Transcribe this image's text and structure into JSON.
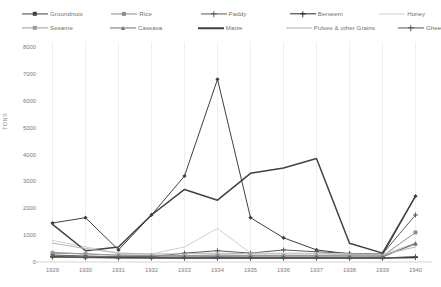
{
  "chart_data": {
    "type": "line",
    "title": "",
    "xlabel": "",
    "ylabel": "TONS",
    "ylim": [
      0,
      8000
    ],
    "ytick_values": [
      0,
      1000,
      2000,
      3000,
      4000,
      5000,
      6000,
      7000,
      8000
    ],
    "ytick_labels": [
      "0",
      "1000",
      "2000",
      "3000",
      "4000",
      "5000",
      "6000",
      "7000",
      "8000"
    ],
    "grid": "vertical",
    "legend_position": "top",
    "categories": [
      "1929",
      "1930",
      "1931",
      "1932",
      "1933",
      "1934",
      "1935",
      "1936",
      "1937",
      "1938",
      "1939",
      "1940"
    ],
    "series": [
      {
        "name": "Groundnuts",
        "color": "#3f3f3f",
        "marker": "diamond",
        "width": 1.0,
        "values": [
          1450,
          1650,
          450,
          1750,
          3200,
          6800,
          1650,
          900,
          450,
          300,
          260,
          2450
        ]
      },
      {
        "name": "Rice",
        "color": "#8c8c8c",
        "marker": "square",
        "width": 1.0,
        "values": [
          330,
          300,
          250,
          240,
          230,
          260,
          240,
          240,
          240,
          230,
          220,
          1100
        ]
      },
      {
        "name": "Paddy",
        "color": "#5a5a5a",
        "marker": "cross",
        "width": 1.0,
        "values": [
          260,
          220,
          200,
          200,
          330,
          420,
          330,
          450,
          380,
          320,
          300,
          1750
        ]
      },
      {
        "name": "Berseem",
        "color": "#2b2b2b",
        "marker": "cross",
        "width": 1.4,
        "values": [
          200,
          180,
          170,
          160,
          150,
          150,
          150,
          150,
          150,
          150,
          150,
          170
        ]
      },
      {
        "name": "Honey",
        "color": "#cfcfcf",
        "marker": "none",
        "width": 1.0,
        "values": [
          800,
          560,
          330,
          300,
          560,
          1250,
          330,
          330,
          330,
          300,
          280,
          700
        ]
      },
      {
        "name": "Sesame",
        "color": "#9a9a9a",
        "marker": "diamond",
        "width": 1.0,
        "values": [
          360,
          300,
          260,
          250,
          240,
          250,
          240,
          240,
          240,
          230,
          230,
          660
        ]
      },
      {
        "name": "Cassava",
        "color": "#707070",
        "marker": "triangle",
        "width": 1.0,
        "values": [
          230,
          210,
          200,
          190,
          190,
          200,
          190,
          190,
          190,
          180,
          180,
          700
        ]
      },
      {
        "name": "Maize",
        "color": "#424242",
        "marker": "none",
        "width": 1.5,
        "values": [
          1400,
          420,
          560,
          1750,
          2700,
          2300,
          3300,
          3500,
          3850,
          700,
          330,
          2450
        ]
      },
      {
        "name": "Pulses & other Grains",
        "color": "#b5b5b5",
        "marker": "none",
        "width": 1.0,
        "values": [
          700,
          500,
          330,
          300,
          300,
          330,
          300,
          300,
          300,
          280,
          270,
          560
        ]
      },
      {
        "name": "Ghee",
        "color": "#555555",
        "marker": "cross",
        "width": 1.0,
        "values": [
          180,
          160,
          150,
          150,
          150,
          150,
          150,
          150,
          150,
          150,
          150,
          200
        ]
      }
    ]
  },
  "legend": {
    "rows": [
      [
        "Groundnuts",
        "Rice",
        "Paddy",
        "Berseem",
        "Honey"
      ],
      [
        "Sesame",
        "Cassava",
        "Maize",
        "Pulses & other Grains",
        "Ghee"
      ]
    ]
  },
  "axes": {
    "y_title": "TONS"
  }
}
